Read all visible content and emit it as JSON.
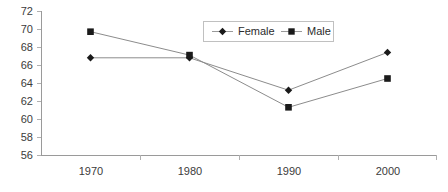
{
  "chart_data": {
    "type": "line",
    "title": "",
    "subtitle": "",
    "xlabel": "",
    "ylabel": "",
    "categories": [
      "1970",
      "1980",
      "1990",
      "2000"
    ],
    "series": [
      {
        "name": "Female",
        "marker": "diamond",
        "values": [
          66.8,
          66.8,
          63.2,
          67.4
        ]
      },
      {
        "name": "Male",
        "marker": "square",
        "values": [
          69.7,
          67.1,
          61.3,
          64.5
        ]
      }
    ],
    "ylim": [
      56,
      72
    ],
    "ytick_step": 2,
    "ytick_labels": [
      "72",
      "70",
      "68",
      "66",
      "64",
      "62",
      "60",
      "58",
      "56"
    ],
    "xtick_labels": [
      "1970",
      "1980",
      "1990",
      "2000"
    ],
    "grid": false,
    "legend_position": "top-center",
    "colors": {
      "line": "#8c8c8c",
      "marker": "#1a1a1a",
      "axis": "#9a9a9a",
      "tick": "#b0b0b0",
      "text": "#3b3b3b",
      "background": "#ffffff",
      "legend_border": "#c0c0c0"
    }
  },
  "legend": {
    "entries": [
      {
        "label": "Female",
        "marker": "diamond-marker-icon"
      },
      {
        "label": "Male",
        "marker": "square-marker-icon"
      }
    ]
  }
}
